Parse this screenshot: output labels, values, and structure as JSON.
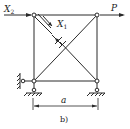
{
  "figure": {
    "caption": "b)",
    "colors": {
      "line": "#2a2a2a",
      "background": "#ffffff"
    }
  },
  "labels": {
    "x2": {
      "main": "X",
      "sub": "2"
    },
    "x1": {
      "main": "X",
      "sub": "1"
    },
    "p": "P",
    "dimension": "a"
  },
  "nodes": [
    {
      "id": "top-left",
      "x": 34,
      "y": 15
    },
    {
      "id": "top-right",
      "x": 97,
      "y": 15
    },
    {
      "id": "bottom-left",
      "x": 34,
      "y": 81
    },
    {
      "id": "bottom-right",
      "x": 97,
      "y": 81
    }
  ],
  "members": [
    {
      "from": "top-left",
      "to": "top-right"
    },
    {
      "from": "top-left",
      "to": "bottom-left"
    },
    {
      "from": "top-right",
      "to": "bottom-right"
    },
    {
      "from": "bottom-left",
      "to": "bottom-right"
    },
    {
      "from": "top-right",
      "to": "bottom-left"
    },
    {
      "from": "top-left",
      "to": "bottom-right",
      "note": "cut member with redundant X1"
    }
  ],
  "loads": [
    {
      "label": "X2",
      "direction": "right",
      "at": "top-left"
    },
    {
      "label": "P",
      "direction": "right",
      "at": "top-right"
    }
  ],
  "supports": [
    {
      "at": "bottom-left",
      "type": "pin + horizontal link"
    },
    {
      "at": "bottom-right",
      "type": "pin"
    }
  ]
}
